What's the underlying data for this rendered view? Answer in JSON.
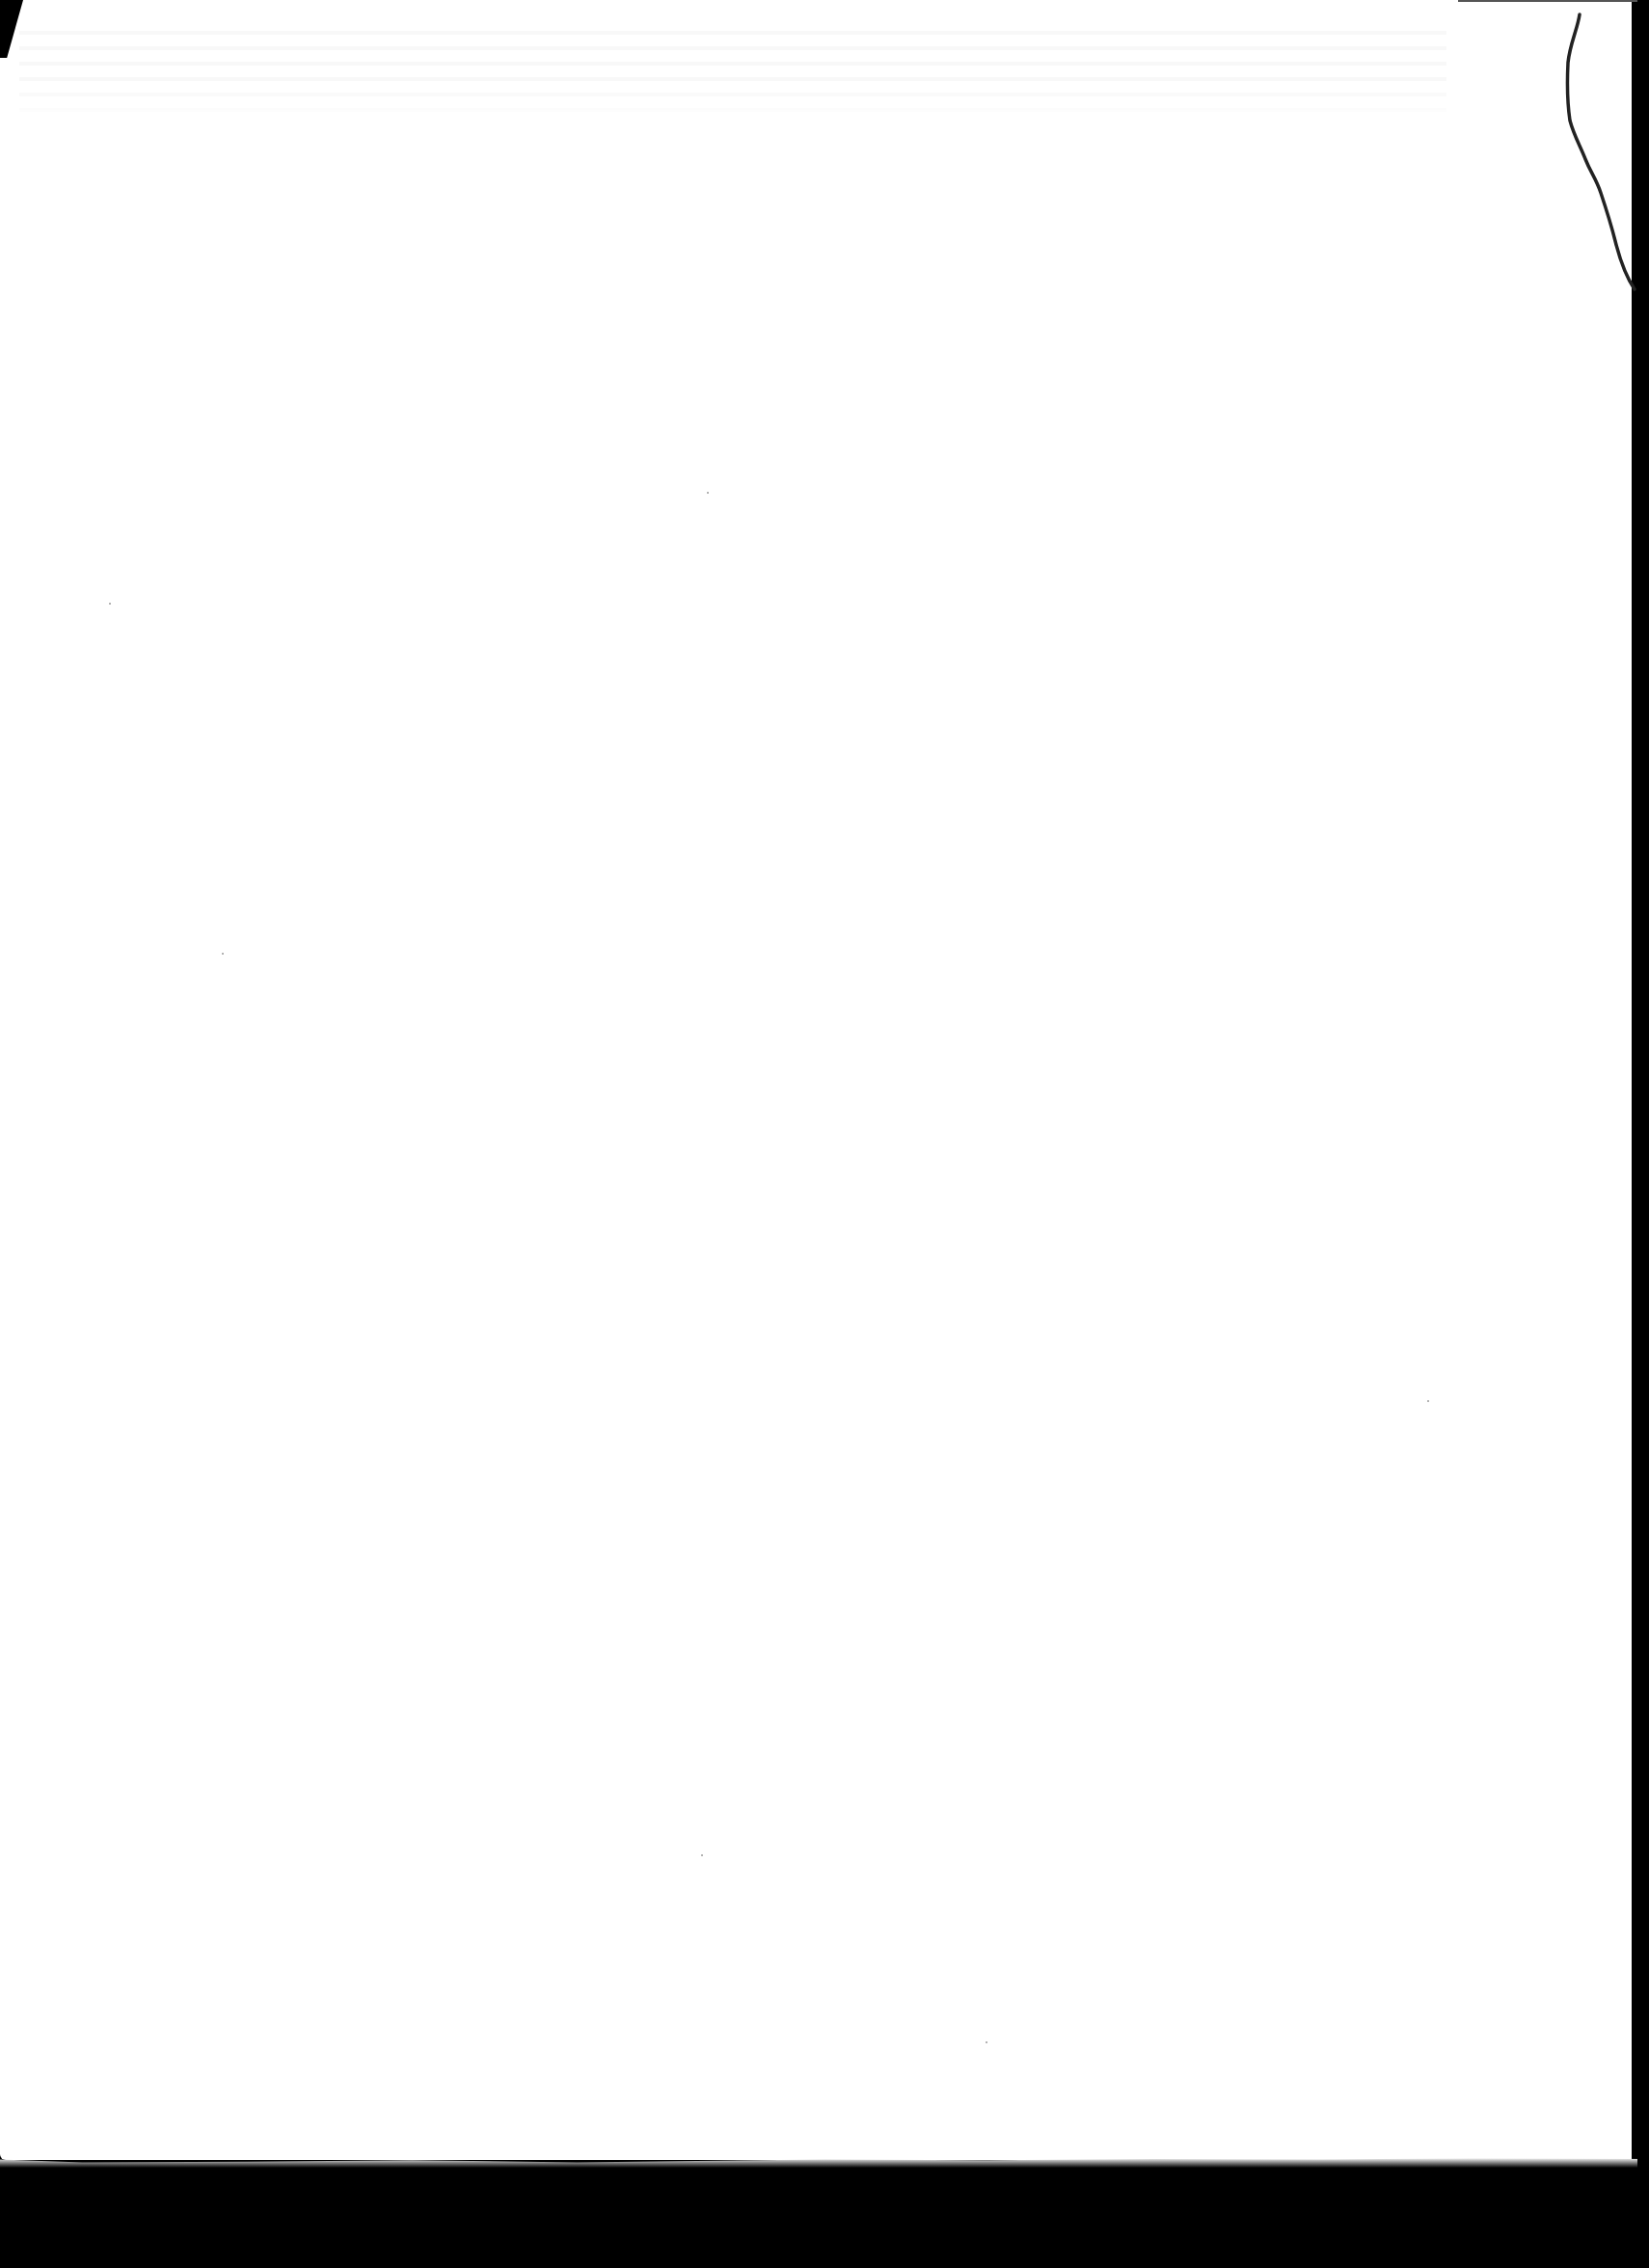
{
  "document": {
    "type": "scanned-blank-page",
    "page_color": "#ffffff",
    "scanner_bed_color": "#000000",
    "crack_color": "#222222",
    "text": ""
  }
}
